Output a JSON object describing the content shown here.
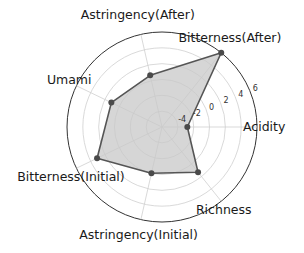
{
  "chart_data": {
    "type": "radar",
    "title": "",
    "categories": [
      "Acidity",
      "Bitterness(After)",
      "Astringency(After)",
      "Umami",
      "Bitterness(Initial)",
      "Astringency(Initial)",
      "Richness"
    ],
    "series": [
      {
        "name": "Taste profile",
        "values": [
          -2.8,
          6.0,
          0.7,
          1.1,
          3.1,
          0.0,
          1.3
        ]
      }
    ],
    "rlim": [
      -6,
      6
    ],
    "r_ticks": [
      -4,
      -2,
      0,
      2,
      4,
      6
    ],
    "r_tick_labels": [
      "-4",
      "-2",
      "0",
      "2",
      "4",
      "6"
    ],
    "grid": true,
    "legend": false
  },
  "style": {
    "fill_color": "#c8c8c8",
    "fill_opacity": 0.75,
    "line_color": "#555555",
    "marker_color": "#4a4a4a",
    "grid_color": "#cfcfcf",
    "outer_ring_color": "#333333"
  }
}
